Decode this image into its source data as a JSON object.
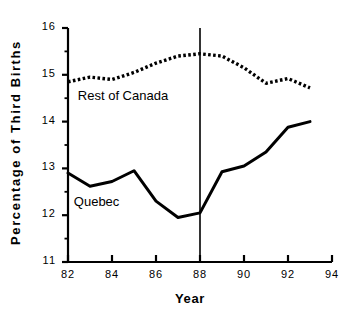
{
  "chart_data": {
    "type": "line",
    "title": "",
    "xlabel": "Year",
    "ylabel": "Percentage of Third Births",
    "xlim": [
      82,
      94
    ],
    "ylim": [
      11,
      16
    ],
    "xticks": [
      "82",
      "84",
      "86",
      "88",
      "90",
      "92",
      "94"
    ],
    "xtick_values": [
      82,
      84,
      86,
      88,
      90,
      92,
      94
    ],
    "yticks": [
      "11",
      "12",
      "13",
      "14",
      "15",
      "16"
    ],
    "ytick_values": [
      11,
      12,
      13,
      14,
      15,
      16
    ],
    "minor_ytick_values": [
      11.5,
      12.5,
      13.5,
      14.5,
      15.5
    ],
    "grid": false,
    "legend_position": "in-plot-annotations",
    "x": [
      82,
      83,
      84,
      85,
      86,
      87,
      88,
      89,
      90,
      91,
      92,
      93
    ],
    "series": [
      {
        "name": "Rest of Canada",
        "style": "dotted",
        "color": "#000000",
        "label_x": 84.5,
        "label_y": 14.55,
        "values": [
          14.85,
          14.95,
          14.9,
          15.05,
          15.25,
          15.4,
          15.45,
          15.4,
          15.15,
          14.82,
          14.92,
          14.72
        ]
      },
      {
        "name": "Quebec",
        "style": "solid",
        "color": "#000000",
        "label_x": 83.3,
        "label_y": 12.28,
        "values": [
          12.9,
          12.62,
          12.72,
          12.95,
          12.3,
          11.95,
          12.05,
          12.93,
          13.05,
          13.35,
          13.88,
          14.0
        ]
      }
    ],
    "annotations": [
      {
        "name": "reference-line-1988",
        "type": "vertical-line",
        "x": 88,
        "y_from": 11,
        "y_to": 16
      }
    ]
  },
  "axis_titles": {
    "y": "Percentage of Third Births",
    "x": "Year"
  }
}
